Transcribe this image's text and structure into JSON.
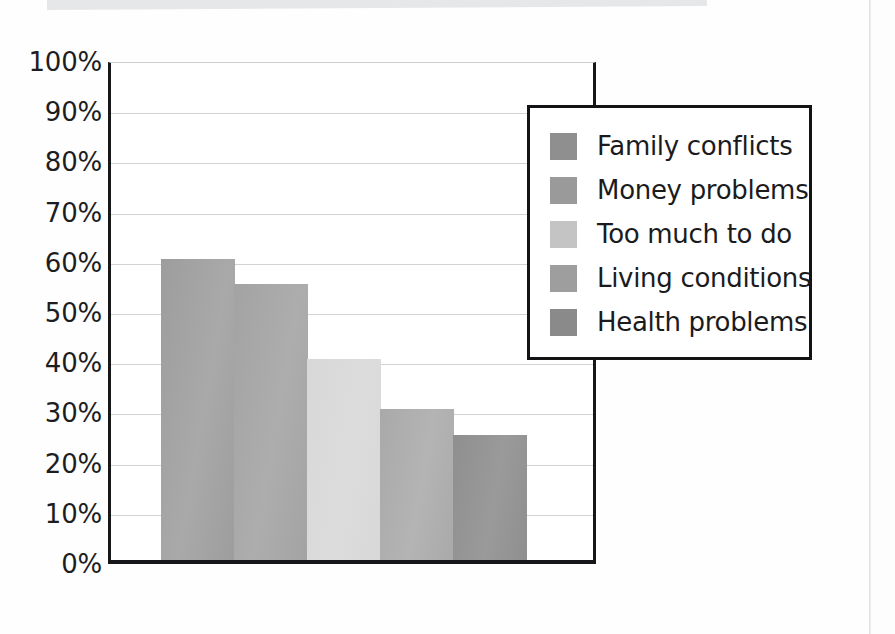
{
  "page": {
    "background_color": "#fefefe",
    "top_band_color": "#e6e7e9"
  },
  "chart_data": {
    "type": "bar",
    "title": "",
    "subtitle": "",
    "xlabel": "",
    "ylabel": "",
    "categories": [
      "Family conflicts",
      "Money problems",
      "Too much to do",
      "Living conditions",
      "Health problems"
    ],
    "values": [
      60,
      55,
      40,
      30,
      25
    ],
    "value_labels": [
      "60%",
      "55%",
      "40%",
      "30%",
      "25%"
    ],
    "ylim": [
      0,
      100
    ],
    "ytick_labels": [
      "100%",
      "90%",
      "80%",
      "70%",
      "60%",
      "50%",
      "40%",
      "30%",
      "20%",
      "10%",
      "0%"
    ],
    "ytick_values": [
      100,
      90,
      80,
      70,
      60,
      50,
      40,
      30,
      20,
      10,
      0
    ],
    "xtick_labels": [],
    "grid": true,
    "grid_color": "#d2d2d2",
    "axis_color": "#17171a",
    "legend_position": "inside-right",
    "series": [
      {
        "name": "Stressors",
        "values": [
          60,
          55,
          40,
          30,
          25
        ]
      }
    ],
    "bar_colors_top": [
      "#9d9d9d",
      "#a3a3a3",
      "#d8d8d8",
      "#a9a9a9",
      "#8f8f8f"
    ],
    "bar_colors_bottom": [
      "#a9a9a9",
      "#adadad",
      "#dcdcdc",
      "#b4b4b4",
      "#9a9a9a"
    ]
  },
  "legend": {
    "items": [
      {
        "label": "Family conflicts",
        "swatch_color": "#8f8f8f"
      },
      {
        "label": "Money problems",
        "swatch_color": "#9a9a9a"
      },
      {
        "label": "Too much to do",
        "swatch_color": "#c4c4c4"
      },
      {
        "label": "Living conditions",
        "swatch_color": "#9e9e9e"
      },
      {
        "label": "Health problems",
        "swatch_color": "#8a8a8a"
      }
    ]
  }
}
